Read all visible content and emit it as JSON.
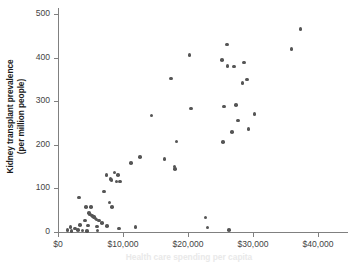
{
  "chart_data": {
    "type": "scatter",
    "title": "",
    "xlabel": "Health care spending per capita",
    "ylabel": "Kidney transplant prevalence (per million people)",
    "ylabel_line1": "Kidney transplant prevalence",
    "ylabel_line2": "(per million people)",
    "xlim": [
      0,
      42000
    ],
    "ylim": [
      0,
      515
    ],
    "xticks": [
      0,
      10000,
      20000,
      30000,
      40000
    ],
    "xtick_labels": [
      "$0",
      "$10,000",
      "$20,000",
      "$30,000",
      "$40,000"
    ],
    "yticks": [
      0,
      100,
      200,
      300,
      400,
      500
    ],
    "ytick_labels": [
      "0",
      "100",
      "200",
      "300",
      "400",
      "500"
    ],
    "grid": false,
    "legend": false,
    "marker_color": "#555555",
    "axis_color": "#808080",
    "points": [
      {
        "x": 1450,
        "y": 5
      },
      {
        "x": 1900,
        "y": 12
      },
      {
        "x": 2050,
        "y": 2
      },
      {
        "x": 2600,
        "y": 8
      },
      {
        "x": 3050,
        "y": 4
      },
      {
        "x": 3250,
        "y": 79
      },
      {
        "x": 3400,
        "y": 16
      },
      {
        "x": 3800,
        "y": 3
      },
      {
        "x": 4150,
        "y": 26
      },
      {
        "x": 4300,
        "y": 57
      },
      {
        "x": 4450,
        "y": 2
      },
      {
        "x": 4600,
        "y": 15
      },
      {
        "x": 4750,
        "y": 44
      },
      {
        "x": 4900,
        "y": 40
      },
      {
        "x": 5100,
        "y": 57
      },
      {
        "x": 5200,
        "y": 38
      },
      {
        "x": 5350,
        "y": 36
      },
      {
        "x": 5500,
        "y": 34
      },
      {
        "x": 5600,
        "y": 33
      },
      {
        "x": 5750,
        "y": 31
      },
      {
        "x": 5900,
        "y": 29
      },
      {
        "x": 6000,
        "y": 13
      },
      {
        "x": 6100,
        "y": 3
      },
      {
        "x": 6300,
        "y": 26
      },
      {
        "x": 6800,
        "y": 20
      },
      {
        "x": 7100,
        "y": 93
      },
      {
        "x": 7450,
        "y": 131
      },
      {
        "x": 7500,
        "y": 14
      },
      {
        "x": 7950,
        "y": 68
      },
      {
        "x": 8100,
        "y": 122
      },
      {
        "x": 8250,
        "y": 119
      },
      {
        "x": 8350,
        "y": 57
      },
      {
        "x": 8700,
        "y": 136
      },
      {
        "x": 9000,
        "y": 116
      },
      {
        "x": 9250,
        "y": 131
      },
      {
        "x": 9400,
        "y": 8
      },
      {
        "x": 9550,
        "y": 116
      },
      {
        "x": 11200,
        "y": 158
      },
      {
        "x": 11900,
        "y": 11
      },
      {
        "x": 12600,
        "y": 172
      },
      {
        "x": 14400,
        "y": 267
      },
      {
        "x": 16400,
        "y": 168
      },
      {
        "x": 17400,
        "y": 352
      },
      {
        "x": 17900,
        "y": 150
      },
      {
        "x": 18000,
        "y": 145
      },
      {
        "x": 18200,
        "y": 208
      },
      {
        "x": 20200,
        "y": 406
      },
      {
        "x": 20500,
        "y": 283
      },
      {
        "x": 22700,
        "y": 33
      },
      {
        "x": 23000,
        "y": 10
      },
      {
        "x": 25200,
        "y": 395
      },
      {
        "x": 25400,
        "y": 207
      },
      {
        "x": 25500,
        "y": 288
      },
      {
        "x": 26000,
        "y": 430
      },
      {
        "x": 26100,
        "y": 381
      },
      {
        "x": 26300,
        "y": 5
      },
      {
        "x": 26800,
        "y": 229
      },
      {
        "x": 27100,
        "y": 380
      },
      {
        "x": 27400,
        "y": 291
      },
      {
        "x": 27700,
        "y": 256
      },
      {
        "x": 28400,
        "y": 342
      },
      {
        "x": 28600,
        "y": 389
      },
      {
        "x": 29100,
        "y": 350
      },
      {
        "x": 29300,
        "y": 236
      },
      {
        "x": 30200,
        "y": 271
      },
      {
        "x": 35900,
        "y": 420
      },
      {
        "x": 37300,
        "y": 465
      }
    ]
  }
}
